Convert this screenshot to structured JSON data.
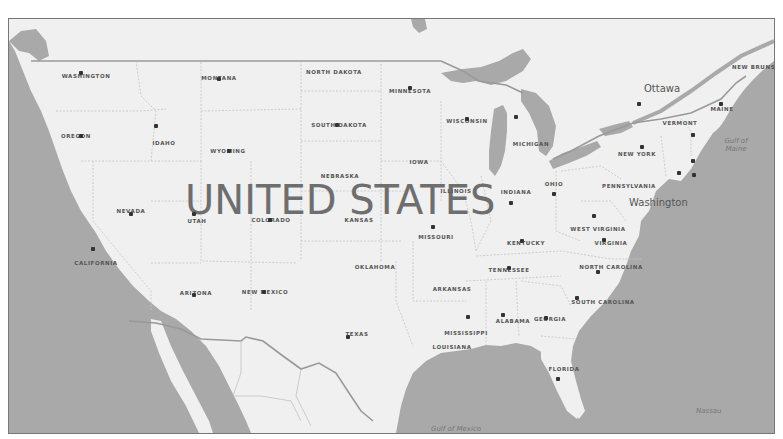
{
  "map": {
    "country_label": "UNITED STATES",
    "colors": {
      "land": "#f0f0f0",
      "water": "#a9a9a9",
      "border": "#888888",
      "state_line": "#c8c8c8",
      "text": "#555555"
    },
    "states": [
      {
        "name": "WASHINGTON",
        "x": 85,
        "y": 75
      },
      {
        "name": "MONTANA",
        "x": 218,
        "y": 77
      },
      {
        "name": "NORTH DAKOTA",
        "x": 333,
        "y": 71
      },
      {
        "name": "MINNESOTA",
        "x": 409,
        "y": 90
      },
      {
        "name": "OREGON",
        "x": 75,
        "y": 135
      },
      {
        "name": "IDAHO",
        "x": 163,
        "y": 142
      },
      {
        "name": "SOUTH DAKOTA",
        "x": 338,
        "y": 124
      },
      {
        "name": "WISCONSIN",
        "x": 466,
        "y": 120
      },
      {
        "name": "MICHIGAN",
        "x": 530,
        "y": 143
      },
      {
        "name": "WYOMING",
        "x": 227,
        "y": 150
      },
      {
        "name": "IOWA",
        "x": 418,
        "y": 161
      },
      {
        "name": "NEBRASKA",
        "x": 339,
        "y": 175
      },
      {
        "name": "NEVADA",
        "x": 130,
        "y": 210
      },
      {
        "name": "UTAH",
        "x": 196,
        "y": 220
      },
      {
        "name": "COLORADO",
        "x": 270,
        "y": 219
      },
      {
        "name": "KANSAS",
        "x": 358,
        "y": 219
      },
      {
        "name": "ILLINOIS",
        "x": 455,
        "y": 190
      },
      {
        "name": "INDIANA",
        "x": 515,
        "y": 191
      },
      {
        "name": "OHIO",
        "x": 553,
        "y": 183
      },
      {
        "name": "PENNSYLVANIA",
        "x": 628,
        "y": 185
      },
      {
        "name": "MISSOURI",
        "x": 435,
        "y": 236
      },
      {
        "name": "WEST VIRGINIA",
        "x": 597,
        "y": 228
      },
      {
        "name": "KENTUCKY",
        "x": 525,
        "y": 242
      },
      {
        "name": "VIRGINIA",
        "x": 610,
        "y": 242
      },
      {
        "name": "CALIFORNIA",
        "x": 95,
        "y": 262
      },
      {
        "name": "OKLAHOMA",
        "x": 374,
        "y": 266
      },
      {
        "name": "TENNESSEE",
        "x": 508,
        "y": 269
      },
      {
        "name": "NORTH CAROLINA",
        "x": 610,
        "y": 266
      },
      {
        "name": "ARKANSAS",
        "x": 451,
        "y": 288
      },
      {
        "name": "ARIZONA",
        "x": 195,
        "y": 292
      },
      {
        "name": "NEW MEXICO",
        "x": 264,
        "y": 291
      },
      {
        "name": "SOUTH CAROLINA",
        "x": 602,
        "y": 301
      },
      {
        "name": "ALABAMA",
        "x": 512,
        "y": 320
      },
      {
        "name": "GEORGIA",
        "x": 549,
        "y": 318
      },
      {
        "name": "TEXAS",
        "x": 356,
        "y": 333
      },
      {
        "name": "MISSISSIPPI",
        "x": 465,
        "y": 332
      },
      {
        "name": "LOUISIANA",
        "x": 451,
        "y": 346
      },
      {
        "name": "FLORIDA",
        "x": 563,
        "y": 368
      },
      {
        "name": "NEW YORK",
        "x": 636,
        "y": 153
      },
      {
        "name": "VERMONT",
        "x": 679,
        "y": 122
      },
      {
        "name": "MAINE",
        "x": 721,
        "y": 108
      },
      {
        "name": "NEW BRUNSWICK",
        "x": 762,
        "y": 66
      }
    ],
    "cities": [
      {
        "x": 80,
        "y": 72
      },
      {
        "x": 218,
        "y": 78
      },
      {
        "x": 155,
        "y": 125
      },
      {
        "x": 409,
        "y": 87
      },
      {
        "x": 466,
        "y": 118
      },
      {
        "x": 515,
        "y": 116
      },
      {
        "x": 336,
        "y": 124
      },
      {
        "x": 80,
        "y": 135
      },
      {
        "x": 228,
        "y": 150
      },
      {
        "x": 130,
        "y": 213
      },
      {
        "x": 193,
        "y": 213
      },
      {
        "x": 269,
        "y": 219
      },
      {
        "x": 432,
        "y": 226
      },
      {
        "x": 510,
        "y": 202
      },
      {
        "x": 553,
        "y": 193
      },
      {
        "x": 593,
        "y": 215
      },
      {
        "x": 521,
        "y": 240
      },
      {
        "x": 603,
        "y": 239
      },
      {
        "x": 92,
        "y": 248
      },
      {
        "x": 508,
        "y": 267
      },
      {
        "x": 597,
        "y": 271
      },
      {
        "x": 193,
        "y": 294
      },
      {
        "x": 263,
        "y": 291
      },
      {
        "x": 576,
        "y": 297
      },
      {
        "x": 467,
        "y": 316
      },
      {
        "x": 502,
        "y": 314
      },
      {
        "x": 545,
        "y": 317
      },
      {
        "x": 347,
        "y": 336
      },
      {
        "x": 557,
        "y": 378
      },
      {
        "x": 641,
        "y": 146
      },
      {
        "x": 692,
        "y": 134
      },
      {
        "x": 692,
        "y": 160
      },
      {
        "x": 678,
        "y": 172
      },
      {
        "x": 693,
        "y": 174
      },
      {
        "x": 638,
        "y": 103
      },
      {
        "x": 720,
        "y": 103
      }
    ],
    "capitals": [
      {
        "name": "Ottawa",
        "x": 643,
        "y": 88
      },
      {
        "name": "Washington",
        "x": 628,
        "y": 202
      }
    ],
    "water_labels": [
      {
        "name": "Gulf of Maine",
        "x": 720,
        "y": 140
      },
      {
        "name": "Gulf of Mexico",
        "x": 430,
        "y": 428
      },
      {
        "name": "Nassau",
        "x": 695,
        "y": 410
      }
    ]
  }
}
